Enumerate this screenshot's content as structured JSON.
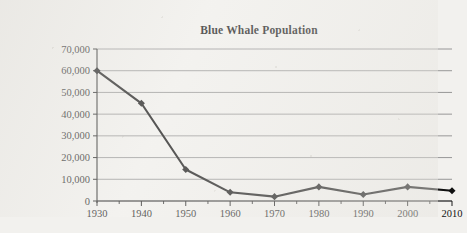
{
  "chart_data": {
    "type": "line",
    "title": "Blue Whale Population",
    "xlabel": "",
    "ylabel": "",
    "categories": [
      1930,
      1940,
      1950,
      1960,
      1970,
      1980,
      1990,
      2000,
      2010
    ],
    "x_tick_labels": [
      "1930",
      "1940",
      "1950",
      "1960",
      "1970",
      "1980",
      "1990",
      "2000",
      "2010"
    ],
    "values": [
      60000,
      45000,
      14500,
      4000,
      2000,
      6500,
      3000,
      6500,
      4700
    ],
    "y_tick_values": [
      0,
      10000,
      20000,
      30000,
      40000,
      50000,
      60000,
      70000
    ],
    "y_tick_labels": [
      "0",
      "10,000",
      "20,000",
      "30,000",
      "40,000",
      "50,000",
      "60,000",
      "70,000"
    ],
    "xlim": [
      1930,
      2010
    ],
    "ylim": [
      0,
      70000
    ],
    "grid": "horizontal",
    "legend": "none",
    "series_color": "#101010",
    "grid_color": "#8d8d8d",
    "marker": "square",
    "minor_x_ticks": true
  }
}
